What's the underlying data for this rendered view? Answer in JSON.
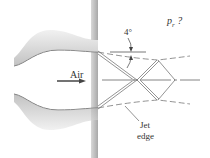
{
  "diagram": {
    "flow_label": "Air",
    "angle_label": "4°",
    "pressure_label": "p",
    "pressure_sub": "r",
    "pressure_suffix": " ?",
    "jet_edge_label_line1": "Jet",
    "jet_edge_label_line2": "edge",
    "colors": {
      "wall": "#b8b8b8",
      "line": "#555555",
      "arrow": "#444444"
    }
  }
}
